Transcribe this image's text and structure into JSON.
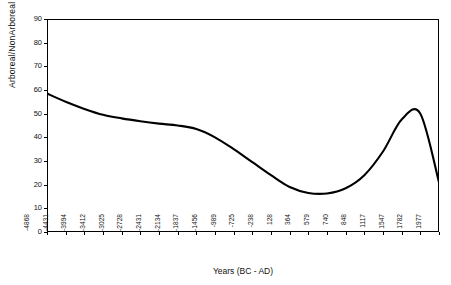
{
  "chart_data": {
    "type": "line",
    "title": "",
    "xlabel": "Years (BC - AD)",
    "ylabel": "Arboreal/NonArboreal Pollen %",
    "ylim": [
      0,
      90
    ],
    "yticks": [
      0,
      10,
      20,
      30,
      40,
      50,
      60,
      70,
      80,
      90
    ],
    "grid": false,
    "legend": null,
    "categories": [
      "-4868",
      "-4431",
      "-3994",
      "-3412",
      "-3025",
      "-2728",
      "-2431",
      "-2134",
      "-1837",
      "-1456",
      "-989",
      "-725",
      "-238",
      "128",
      "364",
      "579",
      "740",
      "848",
      "1117",
      "1547",
      "1782",
      "1977"
    ],
    "values": [
      58.5,
      55.0,
      52.0,
      49.5,
      48.0,
      46.8,
      45.8,
      45.0,
      43.5,
      40.0,
      35.0,
      29.5,
      24.0,
      19.0,
      16.5,
      16.3,
      18.5,
      24.0,
      34.0,
      47.5,
      50.0,
      21.0
    ],
    "line_color": "#000000",
    "line_width": 2.1,
    "axis_color": "#000000",
    "background": "#ffffff"
  },
  "axes": {
    "x_title": "Years (BC - AD)",
    "y_title": "Arboreal/NonArboreal Pollen %"
  }
}
